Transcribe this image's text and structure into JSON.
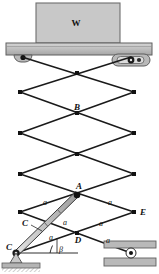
{
  "figure": {
    "colors": {
      "line": "#1a1a1a",
      "block_fill": "#c8c8c8",
      "block_stroke": "#6e6e6e",
      "platform_fill": "#bdbdbd",
      "ground_fill": "#b4b4b4",
      "cylinder_fill": "#c0c0c0",
      "pin_fill": "#111111"
    },
    "labels": {
      "weight": "W",
      "point_a": "A",
      "point_b": "B",
      "point_c_pin": "C",
      "point_c_cylinder": "C",
      "point_d": "D",
      "point_e": "E",
      "angle": "β",
      "segment": "a"
    },
    "segment_labels": [
      "a",
      "a",
      "a",
      "a",
      "a",
      "a"
    ],
    "nodes": {
      "top_left_pin": [
        22,
        55
      ],
      "top_right_roller": [
        131,
        55
      ],
      "left_1": [
        20,
        92
      ],
      "right_1": [
        134,
        92
      ],
      "cross_1": [
        77,
        73
      ],
      "left_2": [
        20,
        133
      ],
      "right_2": [
        134,
        133
      ],
      "cross_2_B": [
        77,
        113
      ],
      "left_3": [
        20,
        174
      ],
      "right_3": [
        134,
        174
      ],
      "cross_3": [
        77,
        154
      ],
      "point_A": [
        77,
        195
      ],
      "left_4": [
        20,
        212
      ],
      "point_E": [
        134,
        212
      ],
      "point_D": [
        77,
        233
      ],
      "point_C": [
        16,
        253
      ],
      "bottom_right_roller": [
        131,
        253
      ]
    }
  }
}
